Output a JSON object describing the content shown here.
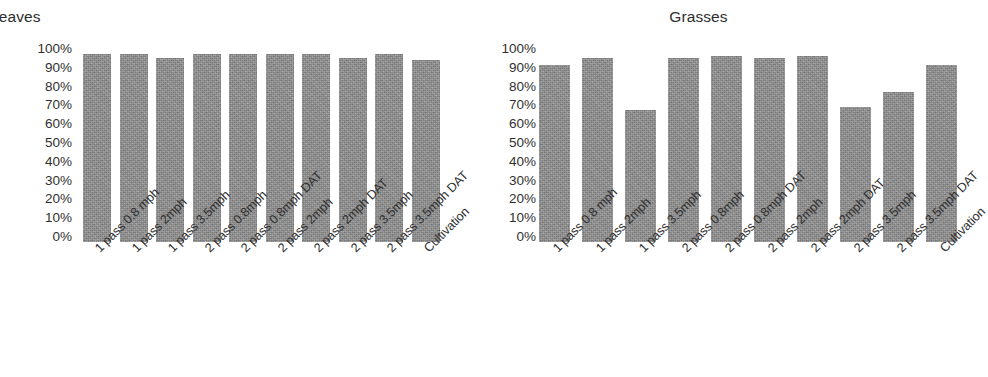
{
  "figure": {
    "background": "#ffffff",
    "bar_color": "#8b8b8b",
    "text_color": "#303030"
  },
  "panels": [
    {
      "id": "broadleaves",
      "title": "Broadleaves"
    },
    {
      "id": "grasses",
      "title": "Grasses"
    }
  ],
  "axis": {
    "yticks": [
      "100%",
      "90%",
      "80%",
      "70%",
      "60%",
      "50%",
      "40%",
      "30%",
      "20%",
      "10%",
      "0%"
    ]
  },
  "chart_data": [
    {
      "type": "bar",
      "title": "Broadleaves",
      "xlabel": "",
      "ylabel": "",
      "ylim": [
        0,
        100
      ],
      "yticks": [
        0,
        10,
        20,
        30,
        40,
        50,
        60,
        70,
        80,
        90,
        100
      ],
      "ytick_labels": [
        "0%",
        "10%",
        "20%",
        "30%",
        "40%",
        "50%",
        "60%",
        "70%",
        "80%",
        "90%",
        "100%"
      ],
      "grid": false,
      "legend": "none",
      "categories": [
        "1 pass 0.8 mph",
        "1 pass 2mph",
        "1 pass 3.5mph",
        "2 pass 0.8mph",
        "2 pass 0.8mph DAT",
        "2 pass 2mph",
        "2 pass 2mph DAT",
        "2 pass 3.5mph",
        "2 pass 3.5mph DAT",
        "Cultivation"
      ],
      "values": [
        100,
        100,
        98,
        100,
        100,
        100,
        100,
        98,
        100,
        97
      ]
    },
    {
      "type": "bar",
      "title": "Grasses",
      "xlabel": "",
      "ylabel": "",
      "ylim": [
        0,
        100
      ],
      "yticks": [
        0,
        10,
        20,
        30,
        40,
        50,
        60,
        70,
        80,
        90,
        100
      ],
      "ytick_labels": [
        "0%",
        "10%",
        "20%",
        "30%",
        "40%",
        "50%",
        "60%",
        "70%",
        "80%",
        "90%",
        "100%"
      ],
      "grid": false,
      "legend": "none",
      "categories": [
        "1 pass 0.8 mph",
        "1 pass 2mph",
        "1 pass 3.5mph",
        "2 pass 0.8mph",
        "2 pass 0.8mph DAT",
        "2 pass 2mph",
        "2 pass 2mph DAT",
        "2 pass 3.5mph",
        "2 pass 3.5mph DAT",
        "Cultivation"
      ],
      "values": [
        94,
        98,
        70,
        98,
        99,
        98,
        99,
        72,
        80,
        94
      ]
    }
  ]
}
